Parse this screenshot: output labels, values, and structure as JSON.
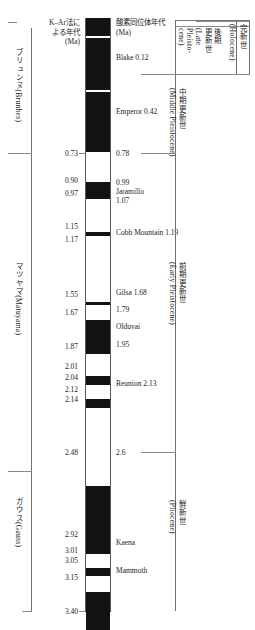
{
  "figure": {
    "axis_unit": "Ma",
    "time_range": [
      0.0,
      3.4
    ]
  },
  "columns": {
    "kar": {
      "header_line1": "K–Ar法に",
      "header_line2": "よる年代",
      "header_line3": "(Ma)"
    },
    "o18": {
      "header_line1": "酸素同位体年代",
      "header_line2": "(Ma)"
    }
  },
  "chrons": [
    {
      "name_ja": "ブリュンヌ",
      "name_en": "(Brunhes)"
    },
    {
      "name_ja": "マツヤマ",
      "name_en": "(Matuyama)"
    },
    {
      "name_ja": "ガウス",
      "name_en": "(Gauss)"
    }
  ],
  "epochs": [
    {
      "name_ja": "完新世",
      "name_en": "(Holocene)"
    },
    {
      "name_ja": "後期\n更新世",
      "name_ja_a": "後期",
      "name_ja_b": "更新世",
      "name_en_a": "(Late",
      "name_en_b": "Pleisto-",
      "name_en_c": "cene)"
    },
    {
      "name_ja": "中期更新世",
      "name_en": "(Middle Pleistocene)"
    },
    {
      "name_ja": "前期更新世",
      "name_en": "(Early Pleistocene)"
    },
    {
      "name_ja": "鮮新世",
      "name_en": "(Pliocene)"
    }
  ],
  "kar_ticks": [
    {
      "value": "0.73",
      "ma": 0.73
    },
    {
      "value": "0.90",
      "ma": 0.9
    },
    {
      "value": "0.97",
      "ma": 0.97
    },
    {
      "value": "1.15",
      "ma": 1.15
    },
    {
      "value": "1.17",
      "ma": 1.17
    },
    {
      "value": "1.55",
      "ma": 1.55
    },
    {
      "value": "1.67",
      "ma": 1.67
    },
    {
      "value": "1.87",
      "ma": 1.87
    },
    {
      "value": "2.01",
      "ma": 2.01
    },
    {
      "value": "2.04",
      "ma": 2.04
    },
    {
      "value": "2.12",
      "ma": 2.12
    },
    {
      "value": "2.14",
      "ma": 2.14
    },
    {
      "value": "2.48",
      "ma": 2.48
    },
    {
      "value": "2.92",
      "ma": 2.92
    },
    {
      "value": "3.01",
      "ma": 3.01
    },
    {
      "value": "3.05",
      "ma": 3.05
    },
    {
      "value": "3.15",
      "ma": 3.15
    },
    {
      "value": "3.40",
      "ma": 3.4
    }
  ],
  "o18_labels": [
    {
      "text": "Blake 0.12",
      "ma": 0.12
    },
    {
      "text": "Emperor 0.42",
      "ma": 0.42
    },
    {
      "text": "0.78",
      "ma": 0.78
    },
    {
      "text": "0.99",
      "ma": 0.99
    },
    {
      "text": "Jaramillo",
      "ma": 1.03
    },
    {
      "text": "1.07",
      "ma": 1.07
    },
    {
      "text": "Cobb Mountain 1.19",
      "ma": 1.19
    },
    {
      "text": "Gilsa 1.68",
      "ma": 1.68
    },
    {
      "text": "1.79",
      "ma": 1.79
    },
    {
      "text": "Olduvai",
      "ma": 1.87
    },
    {
      "text": "1.95",
      "ma": 1.95
    },
    {
      "text": "Reunion 2.13",
      "ma": 2.13
    },
    {
      "text": "2.6",
      "ma": 2.6
    },
    {
      "text": "Kaena",
      "ma": 2.97
    },
    {
      "text": "Mammoth",
      "ma": 3.1
    }
  ],
  "colors": {
    "normal_polarity": "#121212",
    "reversed_polarity": "#ffffff",
    "rule": "#6f6f6f",
    "text": "#1c1c1c"
  }
}
